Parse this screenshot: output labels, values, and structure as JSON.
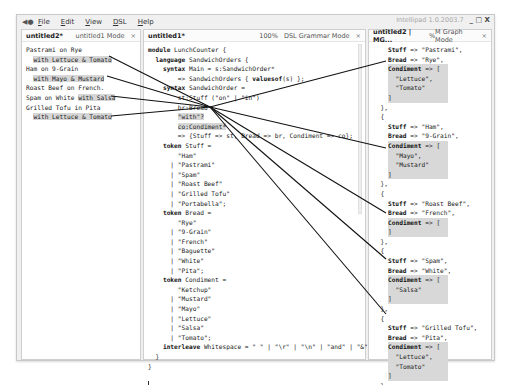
{
  "window": {
    "app_title": "Intellipad 1.0.2003.7",
    "controls": "_ □ X",
    "menu": [
      {
        "label": "File",
        "key": "F",
        "rest": "ile"
      },
      {
        "label": "Edit",
        "key": "E",
        "rest": "dit"
      },
      {
        "label": "View",
        "key": "V",
        "rest": "iew"
      },
      {
        "label": "DSL",
        "key": "D",
        "rest": "SL"
      },
      {
        "label": "Help",
        "key": "H",
        "rest": "elp"
      }
    ]
  },
  "left_panel": {
    "name": "untitled2*",
    "mode": "untitled1 Mode",
    "close": "×",
    "lines": [
      {
        "text": "Pastrami on Rye",
        "indent": "",
        "hl": ""
      },
      {
        "text": "",
        "indent": "  ",
        "hl": "with Lettuce & Tomato"
      },
      {
        "text": "Ham on 9-Grain",
        "indent": "",
        "hl": ""
      },
      {
        "text": "",
        "indent": "  ",
        "hl": "with Mayo & Mustard"
      },
      {
        "text": "Roast Beef on French.",
        "indent": "",
        "hl": ""
      },
      {
        "text": "Spam on White ",
        "indent": "",
        "hl": "with Salsa"
      },
      {
        "text": "Grilled Tofu in Pita",
        "indent": "",
        "hl": ""
      },
      {
        "text": "",
        "indent": "  ",
        "hl": "with Lettuce & Tomato"
      }
    ]
  },
  "mid_panel": {
    "name": "untitled1*",
    "zoom": "100%",
    "mode": "DSL Grammar Mode",
    "close": "×",
    "lines": [
      "module LunchCounter {",
      "  language SandwichOrders {",
      "    syntax Main = s:SandwichOrder*",
      "        => SandwichOrders { valuesof(s) };",
      "    syntax SandwichOrder =",
      "        st:Stuff (\"on\" | \"in\")",
      "        br:Bread",
      "        \"with\"?",
      "        co:Condiment*",
      "        => {Stuff => st, Bread => br, Condiment => co};",
      "    token Stuff =",
      "        \"Ham\"",
      "      | \"Pastrami\"",
      "      | \"Spam\"",
      "      | \"Roast Beef\"",
      "      | \"Grilled Tofu\"",
      "      | \"Portabella\";",
      "    token Bread =",
      "        \"Rye\"",
      "      | \"9-Grain\"",
      "      | \"French\"",
      "      | \"Baguette\"",
      "      | \"White\"",
      "      | \"Pita\";",
      "    token Condiment =",
      "        \"Ketchup\"",
      "      | \"Mustard\"",
      "      | \"Mayo\"",
      "      | \"Lettuce\"",
      "      | \"Salsa\"",
      "      | \"Tomato\";",
      "    interleave Whitespace = \" \" | \"\\r\" | \"\\n\" | \"and\" | \"&\" ;",
      "  }",
      "}"
    ]
  },
  "right_panel": {
    "name": "untitled2 | MG...",
    "percent": "%",
    "mode": "M Graph Mode",
    "close": "×",
    "records": [
      {
        "stuff": "Pastrami",
        "bread": "Rye",
        "condiments": [
          "Lettuce",
          "Tomato"
        ]
      },
      {
        "stuff": "Ham",
        "bread": "9-Grain",
        "condiments": [
          "Mayo",
          "Mustard"
        ]
      },
      {
        "stuff": "Roast Beef",
        "bread": "French",
        "condiments": []
      },
      {
        "stuff": "Spam",
        "bread": "White",
        "condiments": [
          "Salsa"
        ]
      },
      {
        "stuff": "Grilled Tofu",
        "bread": "Pita",
        "condiments": [
          "Lettuce",
          "Tomato"
        ]
      }
    ]
  },
  "colors": {
    "highlight": "#d6d6d6",
    "arrow": "#111111",
    "chrome": "#f0f0f0"
  }
}
